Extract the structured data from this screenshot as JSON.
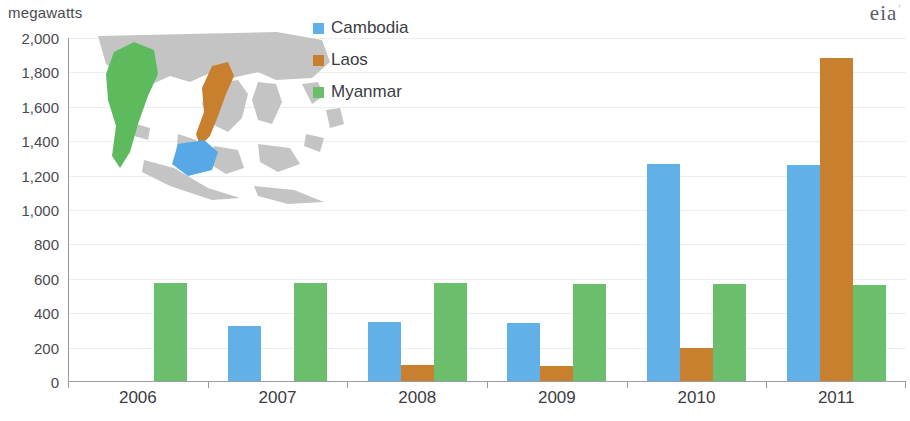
{
  "header": {
    "unit_label": "megawatts",
    "logo_text": "eia",
    "logo_mark": "’"
  },
  "legend": {
    "position": "inside-top-center",
    "items": [
      {
        "label": "Cambodia",
        "color": "#62b0e8",
        "icon": "legend-swatch-icon"
      },
      {
        "label": "Laos",
        "color": "#c8802f",
        "icon": "legend-swatch-icon"
      },
      {
        "label": "Myanmar",
        "color": "#6bbe6b",
        "icon": "legend-swatch-icon"
      }
    ]
  },
  "map_inset": {
    "name": "southeast-asia-map",
    "highlighted": [
      {
        "country": "Myanmar",
        "color": "#5dbb5d"
      },
      {
        "country": "Laos",
        "color": "#c8802f"
      },
      {
        "country": "Cambodia",
        "color": "#56a8e6"
      }
    ],
    "base_color": "#c4c4c4"
  },
  "yticks": [
    {
      "label": "2,000",
      "value": 2000
    },
    {
      "label": "1,800",
      "value": 1800
    },
    {
      "label": "1,600",
      "value": 1600
    },
    {
      "label": "1,400",
      "value": 1400
    },
    {
      "label": "1,200",
      "value": 1200
    },
    {
      "label": "1,000",
      "value": 1000
    },
    {
      "label": "800",
      "value": 800
    },
    {
      "label": "600",
      "value": 600
    },
    {
      "label": "400",
      "value": 400
    },
    {
      "label": "200",
      "value": 200
    },
    {
      "label": "0",
      "value": 0
    }
  ],
  "chart_data": {
    "type": "bar",
    "title": "",
    "subtitle": "",
    "xlabel": "",
    "ylabel": "megawatts",
    "ylim": [
      0,
      2000
    ],
    "ytick_step": 200,
    "grid": true,
    "legend_position": "inside-top-center",
    "categories": [
      "2006",
      "2007",
      "2008",
      "2009",
      "2010",
      "2011"
    ],
    "series": [
      {
        "name": "Cambodia",
        "color": "#62b0e8",
        "values": [
          0,
          325,
          350,
          345,
          1265,
          1260
        ]
      },
      {
        "name": "Laos",
        "color": "#c8802f",
        "values": [
          0,
          0,
          100,
          95,
          200,
          1885
        ]
      },
      {
        "name": "Myanmar",
        "color": "#6bbe6b",
        "values": [
          575,
          575,
          575,
          572,
          570,
          565
        ]
      }
    ]
  }
}
